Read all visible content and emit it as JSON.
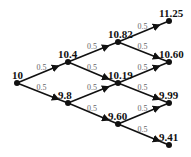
{
  "diagram": {
    "type": "binomial-tree",
    "steps": 3,
    "nodes": [
      {
        "id": "n0",
        "label": "10",
        "x": 17,
        "y": 83
      },
      {
        "id": "n1u",
        "label": "10.4",
        "x": 68,
        "y": 62
      },
      {
        "id": "n1d",
        "label": "9.8",
        "x": 68,
        "y": 103
      },
      {
        "id": "n2uu",
        "label": "10.82",
        "x": 118,
        "y": 42
      },
      {
        "id": "n2ud",
        "label": "10.19",
        "x": 118,
        "y": 83
      },
      {
        "id": "n2dd",
        "label": "9.60",
        "x": 118,
        "y": 124
      },
      {
        "id": "n3uuu",
        "label": "11.25",
        "x": 169,
        "y": 21
      },
      {
        "id": "n3uud",
        "label": "10.60",
        "x": 169,
        "y": 62
      },
      {
        "id": "n3udd",
        "label": "9.99",
        "x": 169,
        "y": 103
      },
      {
        "id": "n3ddd",
        "label": "9.41",
        "x": 169,
        "y": 145
      }
    ],
    "edges": [
      {
        "from": "n0",
        "to": "n1u",
        "prob": "0.5"
      },
      {
        "from": "n0",
        "to": "n1d",
        "prob": "0.5"
      },
      {
        "from": "n1u",
        "to": "n2uu",
        "prob": "0.5"
      },
      {
        "from": "n1u",
        "to": "n2ud",
        "prob": "0.5"
      },
      {
        "from": "n1d",
        "to": "n2ud",
        "prob": "0.5"
      },
      {
        "from": "n1d",
        "to": "n2dd",
        "prob": "0.5"
      },
      {
        "from": "n2uu",
        "to": "n3uuu",
        "prob": "0.5"
      },
      {
        "from": "n2uu",
        "to": "n3uud",
        "prob": "0.5"
      },
      {
        "from": "n2ud",
        "to": "n3uud",
        "prob": "0.5"
      },
      {
        "from": "n2ud",
        "to": "n3udd",
        "prob": "0.5"
      },
      {
        "from": "n2dd",
        "to": "n3udd",
        "prob": "0.5"
      },
      {
        "from": "n2dd",
        "to": "n3ddd",
        "prob": "0.5"
      }
    ],
    "colors": {
      "edge": "#111111",
      "node": "#111111",
      "prob_text": "#666666"
    }
  }
}
